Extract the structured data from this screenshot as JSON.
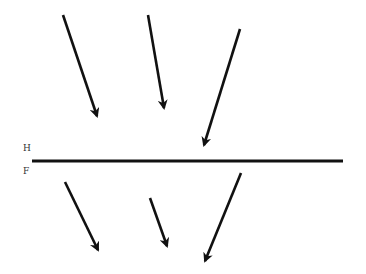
{
  "diagram": {
    "labels": {
      "upper_medium": "H",
      "lower_medium": "F"
    },
    "colors": {
      "background": "#ffffff",
      "stroke": "#111111"
    },
    "boundary": {
      "x1": 32,
      "y1": 161,
      "x2": 343,
      "y2": 161
    },
    "arrows_upper": [
      {
        "x1": 63,
        "y1": 15,
        "x2": 97,
        "y2": 116
      },
      {
        "x1": 148,
        "y1": 15,
        "x2": 164,
        "y2": 108
      },
      {
        "x1": 240,
        "y1": 29,
        "x2": 204,
        "y2": 145
      }
    ],
    "arrows_lower": [
      {
        "x1": 65,
        "y1": 182,
        "x2": 98,
        "y2": 250
      },
      {
        "x1": 150,
        "y1": 198,
        "x2": 167,
        "y2": 246
      },
      {
        "x1": 241,
        "y1": 173,
        "x2": 205,
        "y2": 261
      }
    ]
  }
}
